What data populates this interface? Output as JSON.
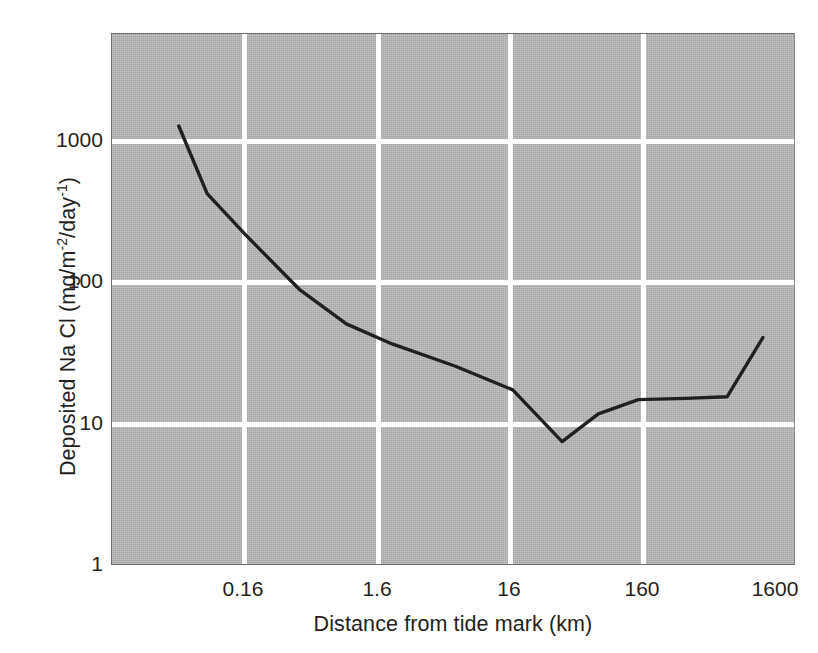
{
  "chart_data": {
    "type": "line",
    "title": "",
    "xlabel": "Distance from tide mark (km)",
    "ylabel": "Deposited Na Cl (mg/m-2/day-1)",
    "ylabel_parts": {
      "prefix": "Deposited Na Cl (mg/m",
      "sup1": "-2",
      "middle": "/day",
      "sup2": "-1",
      "suffix": ")"
    },
    "xscale": "log",
    "yscale": "log",
    "xlim": [
      0.05,
      2600
    ],
    "ylim": [
      1,
      6800
    ],
    "grid": true,
    "grid_color": "#ffffff",
    "plot_background": "#b4b4b4",
    "line_color": "#231f20",
    "legend": null,
    "xticks": [
      {
        "label": "0.16",
        "value": 0.16
      },
      {
        "label": "1.6",
        "value": 1.6
      },
      {
        "label": "16",
        "value": 16
      },
      {
        "label": "160",
        "value": 160
      },
      {
        "label": "1600",
        "value": 1600
      }
    ],
    "yticks": [
      {
        "label": "1",
        "value": 1
      },
      {
        "label": "10",
        "value": 10
      },
      {
        "label": "100",
        "value": 100
      },
      {
        "label": "1000",
        "value": 1000
      }
    ],
    "series": [
      {
        "name": "Deposited Na Cl",
        "x": [
          0.052,
          0.085,
          0.165,
          0.42,
          0.95,
          2.1,
          6.3,
          17,
          40,
          75,
          150,
          340,
          700,
          1300
        ],
        "values": [
          1270,
          420,
          215,
          88,
          50,
          36,
          25,
          17,
          7.3,
          11.5,
          14.5,
          14.8,
          15.2,
          40
        ]
      }
    ]
  }
}
